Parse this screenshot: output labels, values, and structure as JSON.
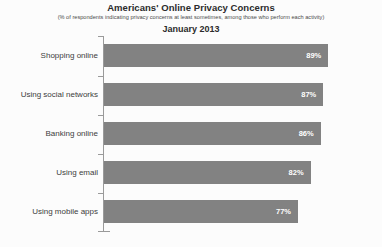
{
  "chart_data": {
    "type": "bar",
    "orientation": "horizontal",
    "title": "Americans' Online Privacy Concerns",
    "subtitle": "(% of respondents indicating privacy concerns at least sometimes, among those who perform each activity)",
    "period": "January 2013",
    "categories": [
      "Shopping online",
      "Using social networks",
      "Banking online",
      "Using email",
      "Using mobile apps"
    ],
    "values": [
      89,
      87,
      86,
      82,
      77
    ],
    "value_labels": [
      "89%",
      "87%",
      "86%",
      "82%",
      "77%"
    ],
    "xlabel": "",
    "ylabel": "",
    "xlim": [
      0,
      100
    ],
    "grid": false,
    "legend": false,
    "bar_color": "#828282",
    "value_label_color": "#ffffff",
    "axis_color": "#9a9a9a",
    "background_color": "#fcfcfc"
  }
}
